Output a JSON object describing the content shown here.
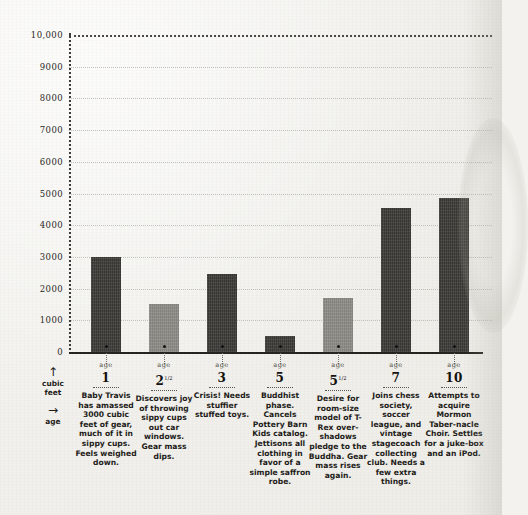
{
  "chart_data": {
    "type": "bar",
    "title": "",
    "xlabel": "age",
    "ylabel": "cubic feet",
    "ylim": [
      0,
      10000
    ],
    "grid": true,
    "legend": "none",
    "yticks": [
      "0",
      "1000",
      "2000",
      "3000",
      "4000",
      "5000",
      "6000",
      "7000",
      "8000",
      "9000",
      "10,000"
    ],
    "ytick_values": [
      0,
      1000,
      2000,
      3000,
      4000,
      5000,
      6000,
      7000,
      8000,
      9000,
      10000
    ],
    "categories": [
      "1",
      "2½",
      "3",
      "5",
      "5½",
      "7",
      "10"
    ],
    "values": [
      3000,
      1500,
      2450,
      500,
      1700,
      4550,
      4850
    ],
    "annotations": [
      "Baby Travis has amassed 3000 cubic feet of gear, much of it in sippy cups. Feels weighed down.",
      "Discovers joy of throwing sippy cups out car windows. Gear mass dips.",
      "Crisis! Needs stuffier stuffed toys.",
      "Buddhist phase. Cancels Pottery Barn Kids catalog. Jettisons all clothing in favor of a simple saffron robe.",
      "Desire for room-size model of T-Rex overshadows pledge to the Buddha. Gear mass rises again.",
      "Joins chess society, soccer league, and vintage stagecoach collecting club. Needs a few extra things.",
      "Attempts to acquire Mormon Tabernacle Choir. Settles for a juke-box and an iPod."
    ]
  },
  "axis_legend": {
    "y": {
      "arrow": "↑",
      "line1": "cubic",
      "line2": "feet"
    },
    "x": {
      "arrow": "→",
      "line1": "age"
    }
  },
  "age_word": "age",
  "columns": [
    {
      "age_word": "age",
      "age_num": "1",
      "age_sup": "",
      "value": 3000,
      "shade": "dark",
      "caption": "Baby Travis has amassed 3000 cubic feet of gear, much of it in sippy cups. Feels weighed down."
    },
    {
      "age_word": "age",
      "age_num": "2",
      "age_sup": "1/2",
      "value": 1500,
      "shade": "light",
      "caption": "Discovers joy of throwing sippy cups out car windows. Gear mass dips."
    },
    {
      "age_word": "age",
      "age_num": "3",
      "age_sup": "",
      "value": 2450,
      "shade": "dark",
      "caption": "Crisis! Needs stuffier stuffed toys."
    },
    {
      "age_word": "age",
      "age_num": "5",
      "age_sup": "",
      "value": 500,
      "shade": "dark",
      "caption": "Buddhist phase. Cancels Pottery Barn Kids catalog. Jettisons all clothing in favor of a simple saffron robe."
    },
    {
      "age_word": "age",
      "age_num": "5",
      "age_sup": "1/2",
      "value": 1700,
      "shade": "light",
      "caption": "Desire for room-size model of T-Rex over-shadows pledge to the Buddha. Gear mass rises again."
    },
    {
      "age_word": "age",
      "age_num": "7",
      "age_sup": "",
      "value": 4550,
      "shade": "dark",
      "caption": "Joins chess society, soccer league, and vintage stagecoach collecting club. Needs a few extra things."
    },
    {
      "age_word": "age",
      "age_num": "10",
      "age_sup": "",
      "value": 4850,
      "shade": "dark",
      "caption": "Attempts to acquire Mormon Taber-nacle Choir. Settles for a juke-box and an iPod."
    }
  ],
  "colors": {
    "paper": "#f3f2ee",
    "bar_dark": "#3c3a36",
    "bar_light": "#8e8c86",
    "axis": "#26241f",
    "gridline": "#b9b7b0",
    "text": "#1c1c1c"
  }
}
